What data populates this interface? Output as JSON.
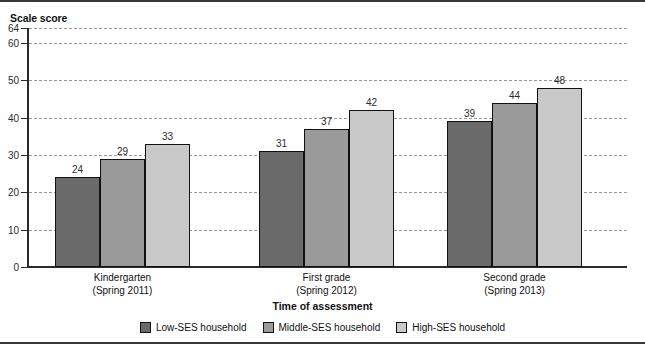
{
  "figure": {
    "clipped_header_text": "",
    "y_axis_title": "Scale score",
    "x_axis_title": "Time of assessment"
  },
  "legend": {
    "items": [
      {
        "label": "Low-SES household",
        "color": "#6a6a6a",
        "swatch_name": "legend-swatch-low-ses"
      },
      {
        "label": "Middle-SES household",
        "color": "#9a9a9a",
        "swatch_name": "legend-swatch-middle-ses"
      },
      {
        "label": "High-SES household",
        "color": "#c9c9c9",
        "swatch_name": "legend-swatch-high-ses"
      }
    ]
  },
  "chart_data": {
    "type": "bar",
    "title": "",
    "subtitle": "",
    "xlabel": "Time of assessment",
    "ylabel": "Scale score",
    "ylim": [
      0,
      64
    ],
    "yticks": [
      0,
      10,
      20,
      30,
      40,
      50,
      60,
      64
    ],
    "ytick_labels": [
      "0",
      "10",
      "20",
      "30",
      "40",
      "50",
      "60",
      "64"
    ],
    "grid": true,
    "grid_style": "dashed-horizontal",
    "legend_position": "bottom-center",
    "grouped": true,
    "categories": [
      "Kindergarten\n(Spring 2011)",
      "First grade\n(Spring 2012)",
      "Second grade\n(Spring 2013)"
    ],
    "category_lines": [
      {
        "line1": "Kindergarten",
        "line2": "(Spring 2011)"
      },
      {
        "line1": "First grade",
        "line2": "(Spring 2012)"
      },
      {
        "line1": "Second grade",
        "line2": "(Spring 2013)"
      }
    ],
    "series": [
      {
        "name": "Low-SES household",
        "color": "#6a6a6a",
        "values": [
          24,
          31,
          39
        ]
      },
      {
        "name": "Middle-SES household",
        "color": "#9a9a9a",
        "values": [
          29,
          37,
          44
        ]
      },
      {
        "name": "High-SES household",
        "color": "#c9c9c9",
        "values": [
          33,
          42,
          48
        ]
      }
    ],
    "data_labels": [
      [
        "24",
        "29",
        "33"
      ],
      [
        "31",
        "37",
        "42"
      ],
      [
        "39",
        "44",
        "48"
      ]
    ]
  }
}
